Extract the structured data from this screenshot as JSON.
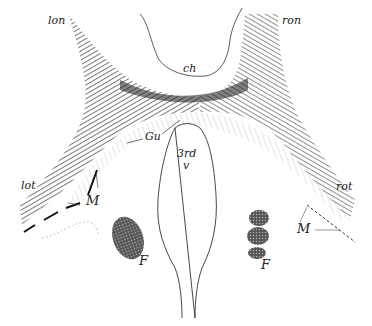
{
  "figure": {
    "colors": {
      "ink": "#1a1a1a",
      "fiber_dark": "#2a2a2a",
      "fiber_light": "#9a9a9a",
      "paper": "#ffffff"
    },
    "labels": {
      "lon": "lon",
      "ron": "ron",
      "ch": "ch",
      "gu": "Gu",
      "third_v_line1": "3rd",
      "third_v_line2": "v",
      "lot": "lot",
      "rot": "rot",
      "m_left": "M",
      "m_right": "M",
      "f_left": "F",
      "f_right": "F"
    }
  }
}
